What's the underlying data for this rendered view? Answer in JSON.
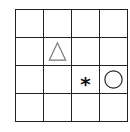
{
  "grid": {
    "rows": 4,
    "cols": 4,
    "line_color": "#222222"
  },
  "symbols": [
    {
      "type": "triangle",
      "row": 2,
      "col": 2,
      "stroke": "#777777",
      "style": "outline"
    },
    {
      "type": "asterisk",
      "row": 3,
      "col": 3,
      "glyph": "*",
      "color": "#111111",
      "style": "bold"
    },
    {
      "type": "circle",
      "row": 3,
      "col": 4,
      "stroke": "#222222",
      "style": "outline"
    }
  ],
  "labels": {
    "asterisk_glyph": "*"
  }
}
